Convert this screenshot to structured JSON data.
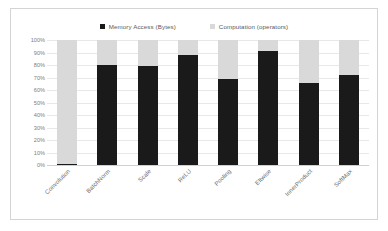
{
  "chart_data": {
    "type": "bar",
    "subtype": "stacked-100-percent",
    "title": "",
    "xlabel": "",
    "ylabel": "",
    "ylim": [
      0,
      100
    ],
    "grid": true,
    "legend_position": "top-center",
    "categories": [
      "Convolution",
      "BatchNorm",
      "Scale",
      "ReLU",
      "Pooling",
      "Eltwise",
      "InnerProduct",
      "SoftMax"
    ],
    "y_ticks": [
      "0%",
      "10%",
      "20%",
      "30%",
      "40%",
      "50%",
      "60%",
      "70%",
      "80%",
      "90%",
      "100%"
    ],
    "series": [
      {
        "name": "Memory Access (Bytes)",
        "color": "#1a1a1a",
        "values": [
          1,
          80,
          79,
          88,
          69,
          91,
          66,
          72
        ]
      },
      {
        "name": "Computation (operators)",
        "color": "#d9d9d9",
        "values": [
          99,
          20,
          21,
          12,
          31,
          9,
          34,
          28
        ]
      }
    ]
  },
  "legend": {
    "entries": [
      {
        "label": "Memory Access (Bytes)",
        "color": "#1a1a1a"
      },
      {
        "label": "Computation (operators)",
        "color": "#d9d9d9"
      }
    ]
  }
}
